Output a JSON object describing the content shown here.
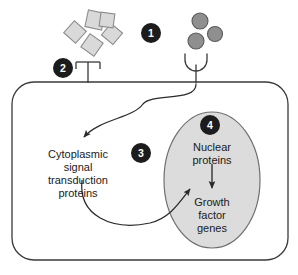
{
  "figure": {
    "width": 298,
    "height": 275,
    "background": "#ffffff"
  },
  "colors": {
    "background": "#ffffff",
    "outline": "#3a3a3a",
    "ligand_fill": "#d9d9d9",
    "ligand_stroke": "#8c8c8c",
    "circle_fill": "#8f8f8f",
    "circle_stroke": "#5a5a5a",
    "nucleus_fill": "#dcdcdc",
    "nucleus_stroke": "#707070",
    "badge_fill": "#1c1c1c",
    "badge_text": "#ffffff",
    "text": "#1a1a1a",
    "arrow": "#2b2b2b"
  },
  "badges": [
    {
      "id": "badge-1",
      "label": "1",
      "x": 151,
      "y": 33,
      "r": 10
    },
    {
      "id": "badge-2",
      "label": "2",
      "x": 63,
      "y": 68,
      "r": 10
    },
    {
      "id": "badge-3",
      "label": "3",
      "x": 141,
      "y": 153,
      "r": 10
    },
    {
      "id": "badge-4",
      "label": "4",
      "x": 210,
      "y": 125,
      "r": 10
    }
  ],
  "ligands": {
    "name": "growth-factor-ligand-squares",
    "count": 5,
    "shape": "square",
    "squares": [
      {
        "cx": 95,
        "cy": 20,
        "size": 17,
        "rotation": 12
      },
      {
        "cx": 75,
        "cy": 32,
        "size": 16,
        "rotation": 42
      },
      {
        "cx": 112,
        "cy": 34,
        "size": 15,
        "rotation": 40
      },
      {
        "cx": 92,
        "cy": 45,
        "size": 16,
        "rotation": 35
      },
      {
        "cx": 107,
        "cy": 20,
        "size": 14,
        "rotation": 8
      }
    ]
  },
  "circles": {
    "name": "growth-factor-ligand-circles",
    "count": 3,
    "shape": "circle",
    "items": [
      {
        "cx": 200,
        "cy": 21,
        "r": 8
      },
      {
        "cx": 215,
        "cy": 34,
        "r": 7.5
      },
      {
        "cx": 196,
        "cy": 41,
        "r": 8
      }
    ]
  },
  "receptors": [
    {
      "name": "receptor-flat-left",
      "type": "flat-bar",
      "x": 88,
      "stem_top": 62,
      "stem_bottom": 82,
      "bar_half_width": 12,
      "prong_depth": 7
    },
    {
      "name": "receptor-cup-right",
      "type": "cup",
      "x": 196,
      "stem_top": 65,
      "stem_bottom": 82,
      "cup_radius": 11
    }
  ],
  "cell": {
    "name": "cell-membrane",
    "x": 12,
    "y": 82,
    "width": 276,
    "height": 178,
    "corner_radius": 22
  },
  "nucleus": {
    "name": "nucleus",
    "cx": 212,
    "cy": 180,
    "rx": 48,
    "ry": 68
  },
  "labels": {
    "cytoplasmic": {
      "name": "cytoplasmic-signal-transduction-proteins-label",
      "x": 78,
      "y": 158,
      "line_height": 13,
      "lines": [
        "Cytoplasmic",
        "signal",
        "transduction",
        "proteins"
      ]
    },
    "nuclear_proteins": {
      "name": "nuclear-proteins-label",
      "x": 212,
      "y": 151,
      "line_height": 13,
      "lines": [
        "Nuclear",
        "proteins"
      ]
    },
    "growth_factor_genes": {
      "name": "growth-factor-genes-label",
      "x": 212,
      "y": 206,
      "line_height": 13,
      "lines": [
        "Growth",
        "factor",
        "genes"
      ]
    }
  },
  "arrows": [
    {
      "name": "arrow-receptor-to-cytoplasm",
      "path": "M 196 84 C 196 104 150 92 142 103 C 132 117 102 118 83 140",
      "description": "S-curved arrow from right receptor down to cytoplasmic signal transduction proteins"
    },
    {
      "name": "arrow-cytoplasm-to-nucleus",
      "path": "M 82 180 C 80 215 112 229 148 223 C 168 219 178 204 190 188",
      "description": "curved arrow from cytoplasmic proteins into the nucleus"
    },
    {
      "name": "arrow-nuclear-proteins-to-genes",
      "path": "M 212 163 L 212 189",
      "description": "straight arrow from nuclear proteins down to growth factor genes"
    }
  ]
}
